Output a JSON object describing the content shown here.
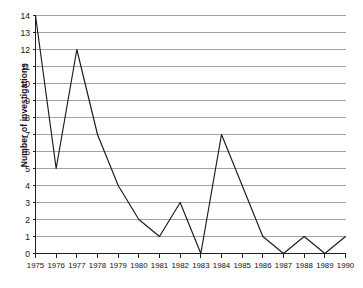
{
  "chart_data": {
    "type": "line",
    "title": "",
    "subtitle": "",
    "xlabel": "",
    "ylabel": "Number of investigations",
    "categories": [
      "1975",
      "1976",
      "1977",
      "1978",
      "1979",
      "1980",
      "1981",
      "1982",
      "1983",
      "1984",
      "1985",
      "1986",
      "1987",
      "1988",
      "1989",
      "1990"
    ],
    "values": [
      14,
      5,
      12,
      7,
      4,
      2,
      1,
      3,
      0,
      7,
      4,
      1,
      0,
      1,
      0,
      1
    ],
    "series": [
      {
        "name": "Number of investigations",
        "values": [
          14,
          5,
          12,
          7,
          4,
          2,
          1,
          3,
          0,
          7,
          4,
          1,
          0,
          1,
          0,
          1
        ]
      }
    ],
    "x": [
      1975,
      1976,
      1977,
      1978,
      1979,
      1980,
      1981,
      1982,
      1983,
      1984,
      1985,
      1986,
      1987,
      1988,
      1989,
      1990
    ],
    "xlim": [
      1975,
      1990
    ],
    "ylim": [
      0,
      14
    ],
    "ytick_labels": [
      "0",
      "1",
      "2",
      "3",
      "4",
      "5",
      "6",
      "7",
      "8",
      "9",
      "10",
      "11",
      "12",
      "13",
      "14"
    ],
    "ytick_values": [
      0,
      1,
      2,
      3,
      4,
      5,
      6,
      7,
      8,
      9,
      10,
      11,
      12,
      13,
      14
    ],
    "xtick_labels": [
      "1975",
      "1976",
      "1977",
      "1978",
      "1979",
      "1980",
      "1981",
      "1982",
      "1983",
      "1984",
      "1985",
      "1986",
      "1987",
      "1988",
      "1989",
      "1990"
    ],
    "grid": "horizontal",
    "legend": "none",
    "annotations": [],
    "colors": {
      "line": "#1a1a1a",
      "grid": "#8c8c8c",
      "axis": "#222222",
      "background": "#ffffff",
      "text": "#111111"
    }
  }
}
